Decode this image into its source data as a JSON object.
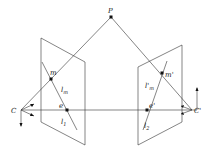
{
  "diagram": {
    "labels": {
      "P": "P",
      "C": "C",
      "C_prime": "C'",
      "m": "m",
      "m_prime": "m'",
      "e": "e",
      "e_prime": "e'",
      "l_m": "l",
      "l_m_sub": "m",
      "l_m_prime": "l'",
      "l_m_prime_sub": "m",
      "l1": "l",
      "l1_sub": "1",
      "l2": "l",
      "l2_sub": "2"
    },
    "colors": {
      "line": "#333333",
      "point": "#111111",
      "background": "#ffffff"
    }
  }
}
